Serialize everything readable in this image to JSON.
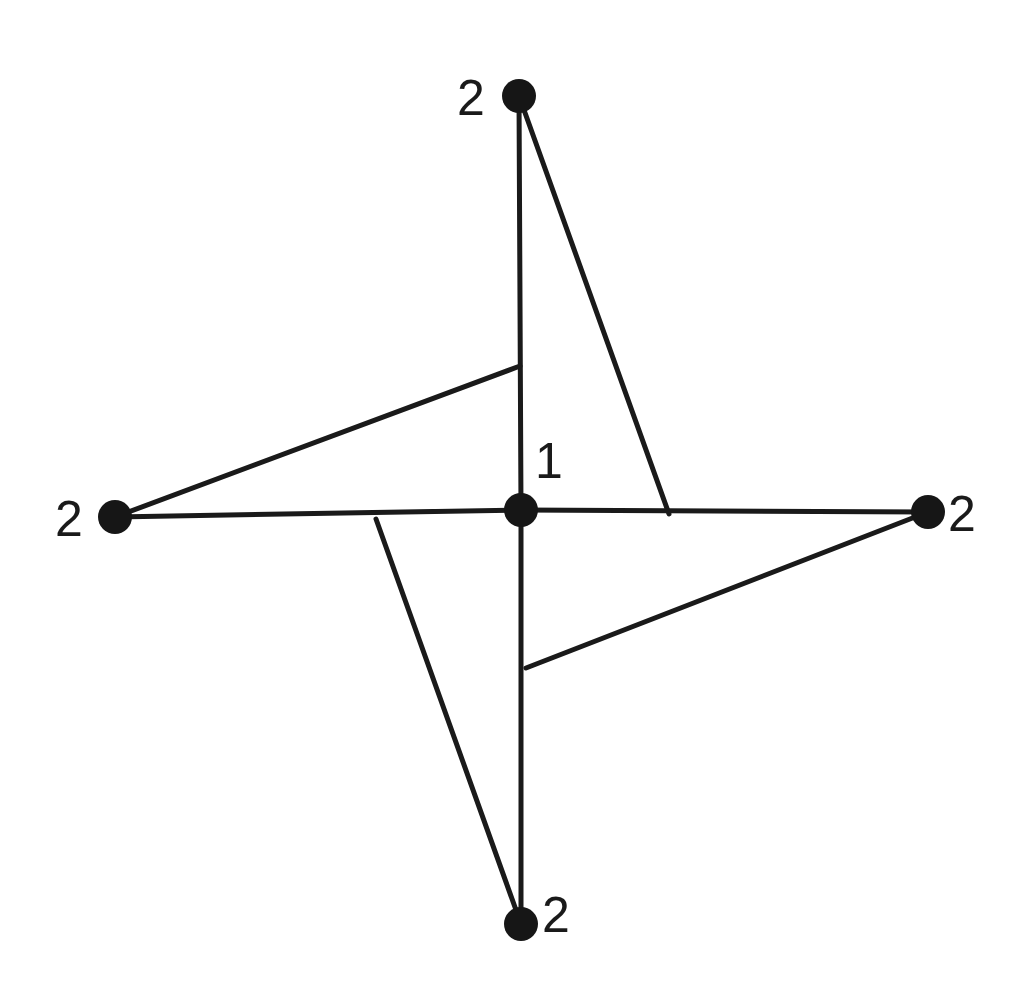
{
  "diagram": {
    "type": "graph",
    "colors": {
      "stroke": "#1a1a1a",
      "node_fill": "#161616",
      "background": "#ffffff"
    },
    "nodes": [
      {
        "id": "center",
        "label": "1",
        "x": 521,
        "y": 510,
        "r": 17,
        "label_x": 535,
        "label_y": 478
      },
      {
        "id": "top",
        "label": "2",
        "x": 519,
        "y": 96,
        "r": 17,
        "label_x": 457,
        "label_y": 115
      },
      {
        "id": "left",
        "label": "2",
        "x": 115,
        "y": 517,
        "r": 17,
        "label_x": 55,
        "label_y": 536
      },
      {
        "id": "right",
        "label": "2",
        "x": 928,
        "y": 512,
        "r": 17,
        "label_x": 948,
        "label_y": 531
      },
      {
        "id": "bottom",
        "label": "2",
        "x": 521,
        "y": 924,
        "r": 17,
        "label_x": 542,
        "label_y": 932
      }
    ],
    "edges": [
      {
        "id": "center-top",
        "x1": 521,
        "y1": 510,
        "x2": 519,
        "y2": 96
      },
      {
        "id": "center-bottom",
        "x1": 521,
        "y1": 510,
        "x2": 521,
        "y2": 924
      },
      {
        "id": "center-left",
        "x1": 521,
        "y1": 510,
        "x2": 115,
        "y2": 517
      },
      {
        "id": "center-right",
        "x1": 521,
        "y1": 510,
        "x2": 928,
        "y2": 512
      },
      {
        "id": "top-slant",
        "x1": 519,
        "y1": 96,
        "x2": 669,
        "y2": 514
      },
      {
        "id": "right-slant",
        "x1": 928,
        "y1": 512,
        "x2": 526,
        "y2": 668
      },
      {
        "id": "bottom-slant",
        "x1": 521,
        "y1": 924,
        "x2": 376,
        "y2": 519
      },
      {
        "id": "left-slant",
        "x1": 115,
        "y1": 517,
        "x2": 520,
        "y2": 366
      }
    ]
  }
}
